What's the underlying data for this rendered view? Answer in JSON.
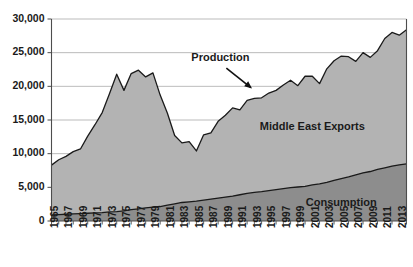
{
  "chart_data": {
    "type": "area",
    "title": "",
    "subtitle": "",
    "xlabel": "",
    "ylabel": "",
    "xlim": [
      1965,
      2014
    ],
    "ylim": [
      0,
      30000
    ],
    "grid": true,
    "legend_position": "inline-annotations",
    "y_ticks": [
      "0",
      "5,000",
      "10,000",
      "15,000",
      "20,000",
      "25,000",
      "30,000"
    ],
    "y_tick_values": [
      0,
      5000,
      10000,
      15000,
      20000,
      25000,
      30000
    ],
    "x_tick_labels": [
      "1965",
      "1967",
      "1969",
      "1971",
      "1973",
      "1975",
      "1977",
      "1979",
      "1981",
      "1983",
      "1985",
      "1987",
      "1989",
      "1991",
      "1993",
      "1995",
      "1997",
      "1999",
      "2001",
      "2003",
      "2005",
      "2007",
      "2009",
      "2011",
      "2013"
    ],
    "x": [
      1965,
      1966,
      1967,
      1968,
      1969,
      1970,
      1971,
      1972,
      1973,
      1974,
      1975,
      1976,
      1977,
      1978,
      1979,
      1980,
      1981,
      1982,
      1983,
      1984,
      1985,
      1986,
      1987,
      1988,
      1989,
      1990,
      1991,
      1992,
      1993,
      1994,
      1995,
      1996,
      1997,
      1998,
      1999,
      2000,
      2001,
      2002,
      2003,
      2004,
      2005,
      2006,
      2007,
      2008,
      2009,
      2010,
      2011,
      2012,
      2013,
      2014
    ],
    "series": [
      {
        "name": "Production",
        "fill_color": "#b3b3b3",
        "line_color": "#1a1a1a",
        "values": [
          8300,
          9100,
          9600,
          10300,
          10700,
          12600,
          14300,
          16100,
          18900,
          21800,
          19400,
          21900,
          22400,
          21400,
          22000,
          18700,
          16000,
          12700,
          11600,
          11800,
          10400,
          12800,
          13100,
          14800,
          15700,
          16800,
          16500,
          17900,
          18200,
          18300,
          19000,
          19400,
          20200,
          20900,
          20100,
          21500,
          21500,
          20400,
          22600,
          23800,
          24500,
          24400,
          23700,
          25000,
          24300,
          25300,
          27100,
          28000,
          27600,
          28400
        ]
      },
      {
        "name": "Consumption",
        "fill_color": "#8d8d8d",
        "line_color": "#1a1a1a",
        "values": [
          900,
          950,
          1000,
          1050,
          1100,
          1150,
          1200,
          1250,
          1350,
          1400,
          1500,
          1700,
          1800,
          1950,
          2050,
          2150,
          2350,
          2550,
          2750,
          2850,
          2950,
          3100,
          3250,
          3400,
          3550,
          3700,
          3900,
          4100,
          4250,
          4350,
          4500,
          4650,
          4800,
          4950,
          5050,
          5150,
          5350,
          5500,
          5750,
          6050,
          6300,
          6550,
          6850,
          7150,
          7350,
          7650,
          7900,
          8150,
          8350,
          8500
        ]
      }
    ],
    "annotations": [
      {
        "name": "production-annotation",
        "text": "Production",
        "target_year": 1993,
        "target_value": 19000
      },
      {
        "name": "middle-east-exports-label",
        "text": "Middle East Exports",
        "year": 2001,
        "value": 13500
      },
      {
        "name": "consumption-label",
        "text": "Consumption",
        "year": 2005,
        "value": 2300
      }
    ]
  }
}
